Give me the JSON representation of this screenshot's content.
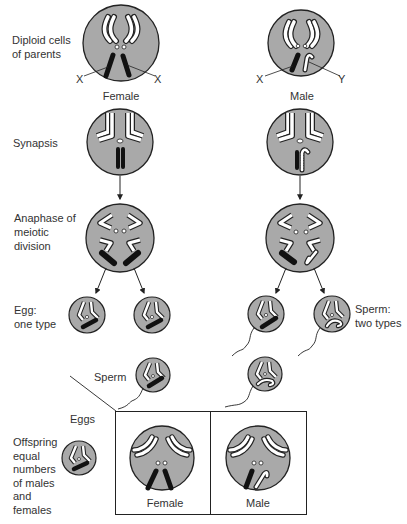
{
  "labels": {
    "parents": "Diploid cells of parents",
    "parents_line1": "Diploid cells",
    "parents_line2": "of parents",
    "synapsis": "Synapsis",
    "anaphase_line1": "Anaphase of",
    "anaphase_line2": "meiotic",
    "anaphase_line3": "division",
    "egg_line1": "Egg:",
    "egg_line2": "one type",
    "sperm_types_line1": "Sperm:",
    "sperm_types_line2": "two types",
    "sperm": "Sperm",
    "eggs": "Eggs",
    "offspring_line1": "Offspring",
    "offspring_line2": "equal",
    "offspring_line3": "numbers",
    "offspring_line4": "of males",
    "offspring_line5": "and",
    "offspring_line6": "females",
    "female": "Female",
    "male": "Male",
    "x": "X",
    "y": "Y",
    "box_female": "Female",
    "box_male": "Male"
  },
  "colors": {
    "cell_fill": "#a9a9a9",
    "outline": "#222222",
    "chromosome_light": "#ffffff",
    "chromosome_dark": "#111111"
  }
}
